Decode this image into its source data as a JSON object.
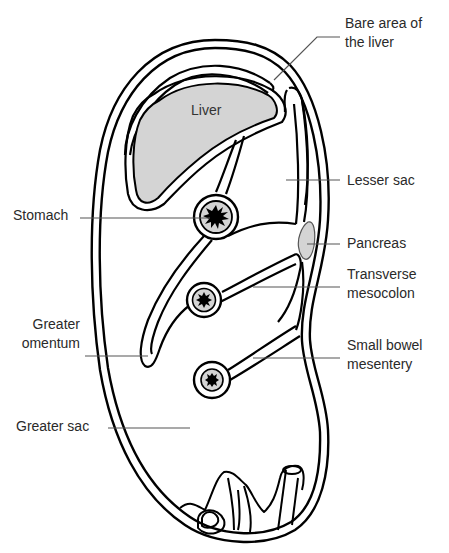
{
  "diagram": {
    "colors": {
      "outline": "#000000",
      "organ_fill": "#d4d4d4",
      "leader_line": "#555555",
      "text": "#2a2a2a",
      "background": "#ffffff"
    },
    "organ_labels": {
      "liver": "Liver"
    },
    "labels": {
      "bare_area_line1": "Bare area of",
      "bare_area_line2": "the liver",
      "lesser_sac": "Lesser sac",
      "stomach": "Stomach",
      "pancreas": "Pancreas",
      "transverse_mesocolon_line1": "Transverse",
      "transverse_mesocolon_line2": "mesocolon",
      "greater_omentum_line1": "Greater",
      "greater_omentum_line2": "omentum",
      "small_bowel_mesentery_line1": "Small bowel",
      "small_bowel_mesentery_line2": "mesentery",
      "greater_sac": "Greater sac"
    },
    "icons": {
      "stomach_lumen": "star-burst",
      "colon_lumen": "star-burst",
      "small_bowel_lumen": "star-burst"
    }
  }
}
